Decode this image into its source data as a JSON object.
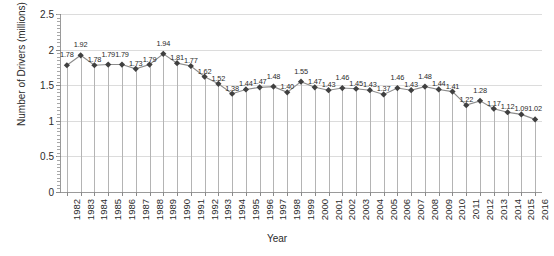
{
  "chart_data": {
    "type": "line",
    "title": "",
    "xlabel": "Year",
    "ylabel": "Number of Drivers (millions)",
    "ylim": [
      0,
      2.5
    ],
    "ytick_labels": [
      "0",
      "0.5",
      "1",
      "1.5",
      "2",
      "2.5"
    ],
    "ytick_values": [
      0,
      0.5,
      1,
      1.5,
      2,
      2.5
    ],
    "grid": true,
    "legend": "none",
    "series_name": "Number of Drivers (millions)",
    "marker": "diamond",
    "marker_color": "#404040",
    "line_color": "#8c8c8c",
    "droplines": true,
    "data_labels": true,
    "categories": [
      "1982",
      "1983",
      "1984",
      "1985",
      "1986",
      "1987",
      "1988",
      "1989",
      "1990",
      "1991",
      "1992",
      "1993",
      "1994",
      "1995",
      "1996",
      "1997",
      "1998",
      "1999",
      "2000",
      "2001",
      "2002",
      "2003",
      "2004",
      "2005",
      "2006",
      "2007",
      "2008",
      "2009",
      "2010",
      "2011",
      "2012",
      "2013",
      "2014",
      "2015",
      "2016"
    ],
    "values": [
      1.78,
      1.92,
      1.78,
      1.79,
      1.79,
      1.73,
      1.79,
      1.94,
      1.81,
      1.77,
      1.62,
      1.52,
      1.38,
      1.44,
      1.47,
      1.48,
      1.4,
      1.55,
      1.47,
      1.43,
      1.46,
      1.45,
      1.43,
      1.37,
      1.46,
      1.43,
      1.48,
      1.44,
      1.41,
      1.22,
      1.28,
      1.17,
      1.12,
      1.09,
      1.02
    ],
    "value_labels": [
      "1.78",
      "1.92",
      "1.78",
      "1.79",
      "1.79",
      "1.73",
      "1.79",
      "1.94",
      "1.81",
      "1.77",
      "1.62",
      "1.52",
      "1.38",
      "1.44",
      "1.47",
      "1.48",
      "1.40",
      "1.55",
      "1.47",
      "1.43",
      "1.46",
      "1.45",
      "1.43",
      "1.37",
      "1.46",
      "1.43",
      "1.48",
      "1.44",
      "1.41",
      "1.22",
      "1.28",
      "1.17",
      "1.12",
      "1.09",
      "1.02"
    ]
  }
}
